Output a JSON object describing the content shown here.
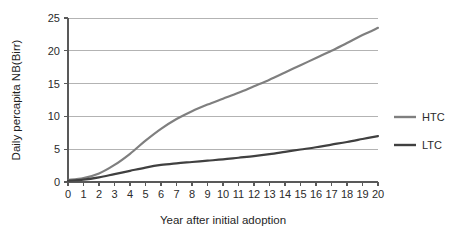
{
  "chart_data": {
    "type": "line",
    "title": "",
    "xlabel": "Year after initial adoption",
    "ylabel": "Daily percapita NB(Birr)",
    "xlim": [
      0,
      20
    ],
    "ylim": [
      0,
      25
    ],
    "ytick_labels": [
      "0",
      "5",
      "10",
      "15",
      "20",
      "25"
    ],
    "ytick_values": [
      0,
      5,
      10,
      15,
      20,
      25
    ],
    "xtick_labels": [
      "0",
      "1",
      "2",
      "3",
      "4",
      "5",
      "6",
      "7",
      "8",
      "9",
      "10",
      "11",
      "12",
      "13",
      "14",
      "15",
      "16",
      "17",
      "18",
      "19",
      "20"
    ],
    "x": [
      0,
      1,
      2,
      3,
      4,
      5,
      6,
      7,
      8,
      9,
      10,
      11,
      12,
      13,
      14,
      15,
      16,
      17,
      18,
      19,
      20
    ],
    "grid": "horizontal",
    "legend_position": "right",
    "series": [
      {
        "name": "HTC",
        "color": "#7f7f7f",
        "values": [
          0.3,
          0.6,
          1.3,
          2.6,
          4.3,
          6.3,
          8.1,
          9.6,
          10.8,
          11.8,
          12.7,
          13.6,
          14.6,
          15.6,
          16.7,
          17.8,
          18.9,
          20.0,
          21.2,
          22.4,
          23.5
        ]
      },
      {
        "name": "LTC",
        "color": "#404040",
        "values": [
          0.2,
          0.35,
          0.7,
          1.2,
          1.7,
          2.2,
          2.6,
          2.85,
          3.05,
          3.25,
          3.45,
          3.7,
          3.95,
          4.25,
          4.6,
          4.95,
          5.3,
          5.7,
          6.1,
          6.55,
          7.0
        ]
      }
    ]
  },
  "legend": {
    "items": [
      {
        "label": "HTC",
        "color": "#7f7f7f"
      },
      {
        "label": "LTC",
        "color": "#404040"
      }
    ]
  },
  "colors": {
    "htc_line": "#7f7f7f",
    "ltc_line": "#404040",
    "gridline": "#b3b3b3",
    "axis": "#595959",
    "text": "#2b2b2b",
    "background": "#ffffff"
  }
}
